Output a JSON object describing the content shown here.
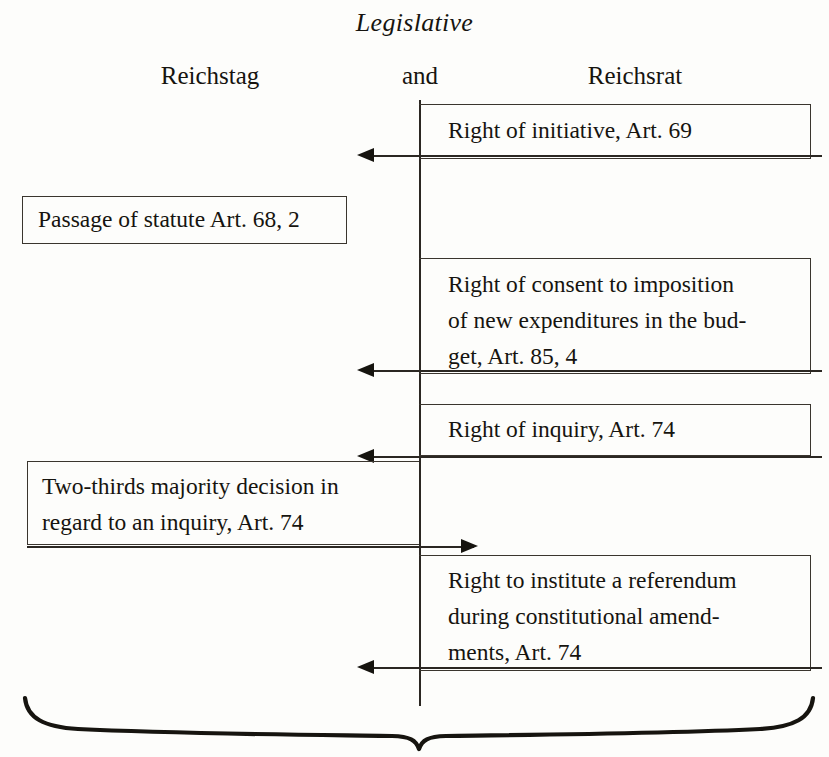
{
  "diagram": {
    "title": "Legislative",
    "columns": {
      "left": "Reichstag",
      "middle": "and",
      "right": "Reichsrat"
    },
    "items": [
      {
        "id": "right-of-initiative",
        "side": "right",
        "text": "Right of initiative, Art. 69",
        "arrow": "left"
      },
      {
        "id": "passage-of-statute",
        "side": "left",
        "text": "Passage of statute Art. 68, 2",
        "arrow": "none"
      },
      {
        "id": "right-of-consent-budget",
        "side": "right",
        "text": "Right of consent to imposition\nof new expenditures in the bud-\nget, Art. 85, 4",
        "arrow": "left"
      },
      {
        "id": "right-of-inquiry",
        "side": "right",
        "text": "Right of inquiry, Art. 74",
        "arrow": "left"
      },
      {
        "id": "two-thirds-majority-inquiry",
        "side": "left",
        "text": "Two-thirds majority decision in\nregard to an inquiry, Art. 74",
        "arrow": "right"
      },
      {
        "id": "right-to-institute-referendum",
        "side": "right",
        "text": "Right to institute a referendum\nduring constitutional amend-\nments, Art. 74",
        "arrow": "left"
      }
    ],
    "colors": {
      "ink": "#16140f",
      "rule": "#3a352e",
      "paper": "#fdfdfb"
    }
  }
}
